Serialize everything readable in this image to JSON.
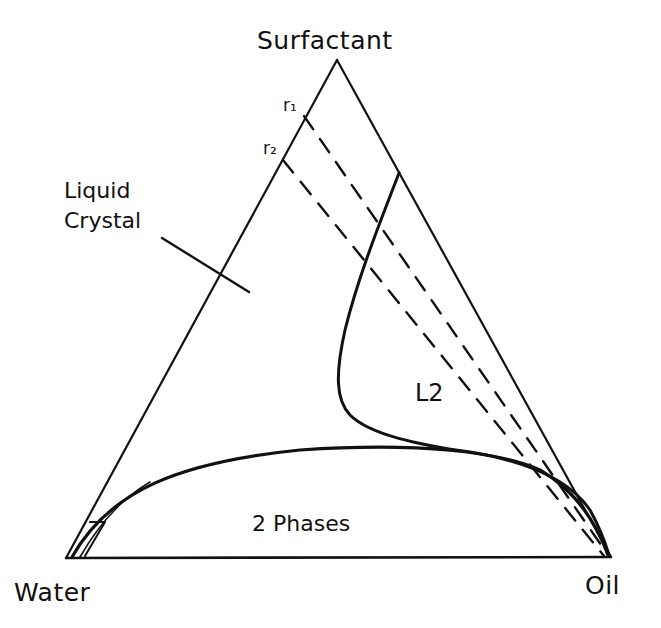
{
  "diagram": {
    "type": "ternary-phase-diagram",
    "vertices": {
      "top": "Surfactant",
      "bottom_left": "Water",
      "bottom_right": "Oil"
    },
    "regions": {
      "liquid_crystal_line1": "Liquid",
      "liquid_crystal_line2": "Crystal",
      "l2": "L2",
      "two_phase": "2 Phases"
    },
    "rays": {
      "r1": "r₁",
      "r2": "r₂"
    },
    "colors": {
      "ink": "#111111",
      "background": "#ffffff"
    }
  }
}
